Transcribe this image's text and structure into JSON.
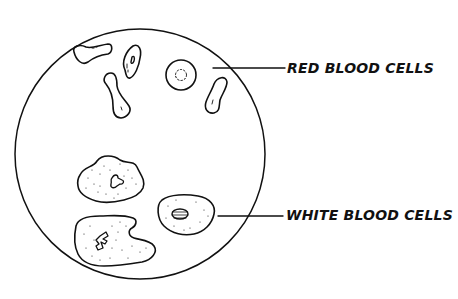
{
  "diagram": {
    "field_of_view": "circular microscope field",
    "labels": {
      "red": "RED BLOOD CELLS",
      "white": "WHITE BLOOD CELLS"
    },
    "colors": {
      "ink": "#111111",
      "background": "#ffffff"
    },
    "red_blood_cells": [
      {
        "view": "side, dumbbell",
        "x": 95,
        "y": 55
      },
      {
        "view": "tilted oval with central slit",
        "x": 130,
        "y": 66
      },
      {
        "view": "face-on disc with dotted center",
        "x": 181,
        "y": 75
      },
      {
        "view": "side, dumbbell",
        "x": 117,
        "y": 101
      },
      {
        "view": "side, dumbbell",
        "x": 216,
        "y": 93
      }
    ],
    "white_blood_cells": [
      {
        "view": "granular with lobed nucleus",
        "x": 110,
        "y": 182
      },
      {
        "view": "granular with lobed nucleus",
        "x": 108,
        "y": 239
      },
      {
        "view": "oval with striped nucleus",
        "x": 189,
        "y": 215
      }
    ]
  }
}
